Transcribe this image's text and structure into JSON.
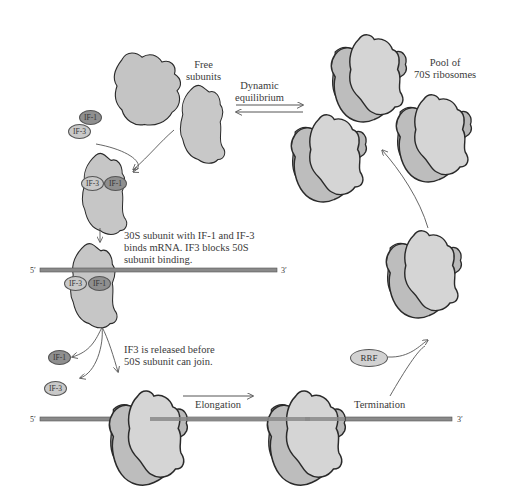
{
  "colors": {
    "subunit_fill": "#c4c4c4",
    "small_subunit_fill": "#d3d3d3",
    "outline": "#2a2a2a",
    "mrna": "#8a8a8a",
    "if1": "#8f8f8f",
    "if3": "#c9c9c9",
    "rrf": "#d2d2d2",
    "arrow": "#555555"
  },
  "labels": {
    "free_subunits": [
      "Free",
      "subunits"
    ],
    "dynamic_equilibrium": [
      "Dynamic",
      "equilibrium"
    ],
    "pool": [
      "Pool of",
      "70S ribosomes"
    ],
    "step_binds_mrna": [
      "30S subunit with IF-1 and IF-3",
      "binds mRNA. IF3 blocks 50S",
      "subunit binding."
    ],
    "step_if3_released": [
      "IF3 is released before",
      "50S subunit can join."
    ],
    "elongation": "Elongation",
    "termination": "Termination"
  },
  "factors": {
    "if1": "IF-1",
    "if3": "IF-3",
    "rrf": "RRF"
  },
  "mrna": {
    "five_prime": "5′",
    "three_prime": "3′"
  }
}
